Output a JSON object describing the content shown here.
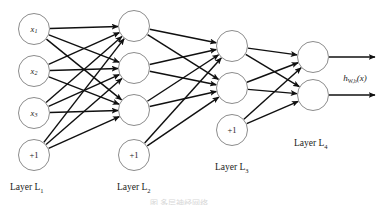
{
  "diagram": {
    "output_label": {
      "base": "h",
      "sub": "W,b",
      "arg": "(x)"
    },
    "edge_color": "#101010",
    "node_stroke_color": "#8c8c8c",
    "node_fill_color": "#ffffff",
    "bias_label": "+1",
    "layers": [
      {
        "id": "L1",
        "label_base": "Layer L",
        "label_sub": "1",
        "label_x": 10,
        "label_y": 190,
        "cx": 34,
        "r": 15.5,
        "nodes": [
          {
            "name": "input-x1",
            "base": "x",
            "sub": "1",
            "cy": 29,
            "type": "input"
          },
          {
            "name": "input-x2",
            "base": "x",
            "sub": "2",
            "cy": 71,
            "type": "input"
          },
          {
            "name": "input-x3",
            "base": "x",
            "sub": "3",
            "cy": 113,
            "type": "input"
          },
          {
            "name": "bias-layer1",
            "base": "+1",
            "sub": "",
            "cy": 155,
            "type": "bias"
          }
        ]
      },
      {
        "id": "L2",
        "label_base": "Layer L",
        "label_sub": "2",
        "label_x": 117,
        "label_y": 190,
        "cx": 134,
        "r": 15.5,
        "nodes": [
          {
            "name": "hidden2-n1",
            "base": "",
            "sub": "",
            "cy": 26,
            "type": "hidden"
          },
          {
            "name": "hidden2-n2",
            "base": "",
            "sub": "",
            "cy": 68,
            "type": "hidden"
          },
          {
            "name": "hidden2-n3",
            "base": "",
            "sub": "",
            "cy": 110,
            "type": "hidden"
          },
          {
            "name": "bias-layer2",
            "base": "+1",
            "sub": "",
            "cy": 155,
            "type": "bias"
          }
        ]
      },
      {
        "id": "L3",
        "label_base": "Layer L",
        "label_sub": "3",
        "label_x": 215,
        "label_y": 170,
        "cx": 232,
        "r": 15.5,
        "nodes": [
          {
            "name": "hidden3-n1",
            "base": "",
            "sub": "",
            "cy": 46,
            "type": "hidden"
          },
          {
            "name": "hidden3-n2",
            "base": "",
            "sub": "",
            "cy": 88,
            "type": "hidden"
          },
          {
            "name": "bias-layer3",
            "base": "+1",
            "sub": "",
            "cy": 130,
            "type": "bias"
          }
        ]
      },
      {
        "id": "L4",
        "label_base": "Layer L",
        "label_sub": "4",
        "label_x": 294,
        "label_y": 146,
        "cx": 313,
        "r": 15.5,
        "nodes": [
          {
            "name": "output-n1",
            "base": "",
            "sub": "",
            "cy": 57,
            "type": "output"
          },
          {
            "name": "output-n2",
            "base": "",
            "sub": "",
            "cy": 95,
            "type": "output"
          }
        ]
      }
    ],
    "output_arrows": [
      {
        "name": "output-arrow-1",
        "x1": 329,
        "y1": 57,
        "x2": 375,
        "y2": 57
      },
      {
        "name": "output-arrow-2",
        "x1": 329,
        "y1": 95,
        "x2": 375,
        "y2": 95
      }
    ],
    "output_label_pos": {
      "x": 355,
      "y": 78
    },
    "connections": [
      {
        "from": "L1",
        "to": "L2",
        "from_nodes": [
          0,
          1,
          2,
          3
        ],
        "to_nodes": [
          0,
          1,
          2
        ]
      },
      {
        "from": "L2",
        "to": "L3",
        "from_nodes": [
          0,
          1,
          2,
          3
        ],
        "to_nodes": [
          0,
          1
        ]
      },
      {
        "from": "L3",
        "to": "L4",
        "from_nodes": [
          0,
          1,
          2
        ],
        "to_nodes": [
          0,
          1
        ]
      }
    ],
    "bottom_caption": "图 多层神经网络"
  }
}
